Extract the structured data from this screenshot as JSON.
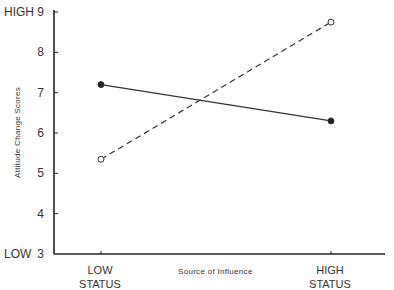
{
  "chart_data": {
    "type": "line",
    "title": "",
    "xlabel": "Source of Influence",
    "ylabel": "Attitude Change Scores",
    "categories": [
      "LOW STATUS",
      "HIGH STATUS"
    ],
    "category_lines": [
      [
        "LOW",
        "STATUS"
      ],
      [
        "HIGH",
        "STATUS"
      ]
    ],
    "ylim": [
      3,
      9
    ],
    "yticks": [
      3,
      4,
      5,
      6,
      7,
      8,
      9
    ],
    "y_end_labels": {
      "high": "HIGH",
      "low": "LOW"
    },
    "grid": false,
    "legend": null,
    "series": [
      {
        "name": "solid line, filled markers",
        "style": "solid",
        "marker": "filled-circle",
        "values": [
          7.2,
          6.3
        ]
      },
      {
        "name": "dashed line, open markers",
        "style": "dashed",
        "marker": "open-circle",
        "values": [
          5.35,
          8.75
        ]
      }
    ]
  }
}
